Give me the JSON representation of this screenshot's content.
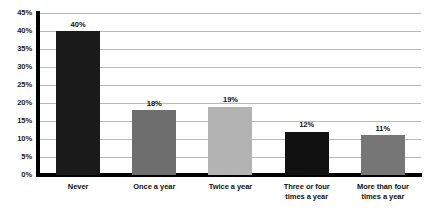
{
  "chart_data": {
    "type": "bar",
    "title": "",
    "subtitle": "",
    "xlabel": "",
    "ylabel": "",
    "categories": [
      "Never",
      "Once a year",
      "Twice a year",
      "Three or four\ntimes a year",
      "More than four\ntimes a year"
    ],
    "values": [
      40,
      18,
      19,
      12,
      11
    ],
    "data_labels": [
      "40%",
      "18%",
      "19%",
      "12%",
      "11%"
    ],
    "bar_colors": [
      "#1a1a1a",
      "#6e6e6e",
      "#b3b3b3",
      "#111111",
      "#767676"
    ],
    "ylim": [
      0,
      45
    ],
    "ytick_values": [
      0,
      5,
      10,
      15,
      20,
      25,
      30,
      35,
      40,
      45
    ],
    "ytick_labels": [
      "0%",
      "5%",
      "10%",
      "15%",
      "20%",
      "25%",
      "30%",
      "35%",
      "40%",
      "45%"
    ],
    "grid": true,
    "grid_color": "#b9b9b9",
    "axis_color": "#000000",
    "legend": "none",
    "background": "#ffffff"
  }
}
